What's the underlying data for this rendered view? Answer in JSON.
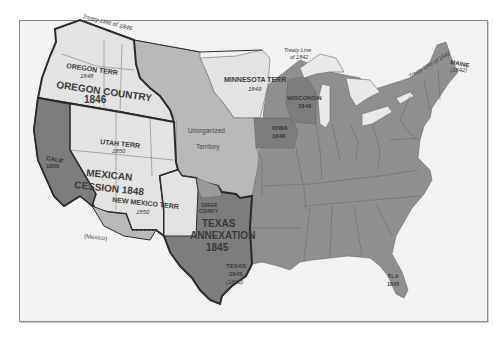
{
  "map": {
    "title": "Territorial Growth of the United States, 1840s-1850",
    "colors": {
      "background": "#ffffff",
      "sea": "#f2f2f0",
      "frame": "#8a8a8a",
      "acquisition_light": "#e3e3e1",
      "unorganized": "#b9b9b7",
      "states": "#8f8f8d",
      "new_states": "#7d7d7b",
      "lakes": "#e9e9e7",
      "bold_border": "#2a2a2a",
      "state_line": "#6a6a68",
      "text": "#3a3a3a"
    },
    "treaty_lines": [
      {
        "label": "Treaty Line of 1846"
      },
      {
        "label": "Treaty Line of 1842",
        "label_line1": "Treaty Line",
        "label_line2": "of 1842"
      },
      {
        "label": "Treaty Line of 1842"
      }
    ],
    "regions": [
      {
        "name": "OREGON COUNTRY",
        "year": "1846"
      },
      {
        "name": "MEXICAN CESSION 1848",
        "line1": "MEXICAN",
        "line2": "CESSION 1848"
      },
      {
        "name": "TEXAS ANNEXATION",
        "line1": "TEXAS",
        "line2": "ANNEXATION",
        "year": "1845"
      },
      {
        "name": "Unorganized Territory",
        "line1": "Unorganized",
        "line2": "Territory"
      }
    ],
    "territories": [
      {
        "name": "OREGON TERR",
        "year": "1848"
      },
      {
        "name": "UTAH TERR",
        "year": "1850"
      },
      {
        "name": "NEW MEXICO TERR",
        "year": "1850"
      },
      {
        "name": "MINNESOTA TERR",
        "year": "1849"
      }
    ],
    "states": [
      {
        "name": "CALIF",
        "year": "1850"
      },
      {
        "name": "TEXAS",
        "year": "1845",
        "note": "(1850)"
      },
      {
        "name": "IOWA",
        "year": "1846"
      },
      {
        "name": "WISCONSIN",
        "year": "1848"
      },
      {
        "name": "FLA",
        "year": "1845"
      },
      {
        "name": "MAINE",
        "year": "(1842)"
      }
    ],
    "other_labels": {
      "greer_county_line1": "GREER",
      "greer_county_line2": "COUNTY",
      "mexico": "(Mexico)"
    }
  }
}
